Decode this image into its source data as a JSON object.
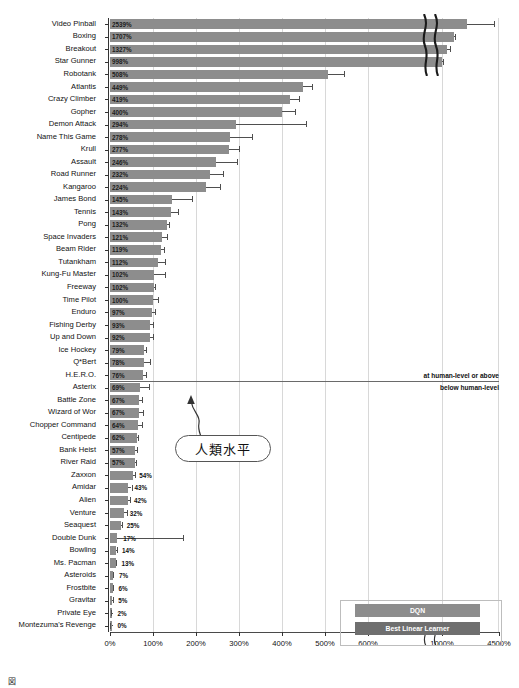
{
  "chart_data": {
    "type": "bar",
    "title": "",
    "xlabel": "",
    "ylabel": "",
    "orientation": "horizontal",
    "grid": true,
    "legend_position": "bottom-right",
    "xlim": [
      0,
      4500
    ],
    "axis_break": {
      "after": 600,
      "before": 1000,
      "note": "broken x-axis between 600% and 1000%"
    },
    "xticks": [
      "0%",
      "100%",
      "200%",
      "300%",
      "400%",
      "500%",
      "600%",
      "1000%",
      "4500%"
    ],
    "xtick_values": [
      0,
      100,
      200,
      300,
      400,
      500,
      600,
      1000,
      4500
    ],
    "human_level_value": 100,
    "categories": [
      "Video Pinball",
      "Boxing",
      "Breakout",
      "Star Gunner",
      "Robotank",
      "Atlantis",
      "Crazy Climber",
      "Gopher",
      "Demon Attack",
      "Name This Game",
      "Krull",
      "Assault",
      "Road Runner",
      "Kangaroo",
      "James Bond",
      "Tennis",
      "Pong",
      "Space Invaders",
      "Beam Rider",
      "Tutankham",
      "Kung-Fu Master",
      "Freeway",
      "Time Pilot",
      "Enduro",
      "Fishing Derby",
      "Up and Down",
      "Ice Hockey",
      "Q*Bert",
      "H.E.R.O.",
      "Asterix",
      "Battle Zone",
      "Wizard of Wor",
      "Chopper Command",
      "Centipede",
      "Bank Heist",
      "River Raid",
      "Zaxxon",
      "Amidar",
      "Alien",
      "Venture",
      "Seaquest",
      "Double Dunk",
      "Bowling",
      "Ms. Pacman",
      "Asteroids",
      "Frostbite",
      "Gravitar",
      "Private Eye",
      "Montezuma's Revenge"
    ],
    "values": [
      2539,
      1707,
      1327,
      998,
      508,
      449,
      419,
      400,
      294,
      278,
      277,
      246,
      232,
      224,
      145,
      143,
      132,
      121,
      119,
      112,
      102,
      102,
      100,
      97,
      93,
      92,
      79,
      78,
      76,
      69,
      67,
      67,
      64,
      62,
      57,
      57,
      54,
      43,
      42,
      32,
      25,
      17,
      14,
      13,
      7,
      6,
      5,
      2,
      0
    ],
    "value_labels": [
      "2539%",
      "1707%",
      "1327%",
      "998%",
      "508%",
      "449%",
      "419%",
      "400%",
      "294%",
      "278%",
      "277%",
      "246%",
      "232%",
      "224%",
      "145%",
      "143%",
      "132%",
      "121%",
      "119%",
      "112%",
      "102%",
      "102%",
      "100%",
      "97%",
      "93%",
      "92%",
      "79%",
      "78%",
      "76%",
      "69%",
      "67%",
      "67%",
      "64%",
      "62%",
      "57%",
      "57%",
      "54%",
      "43%",
      "42%",
      "32%",
      "25%",
      "17%",
      "14%",
      "13%",
      "7%",
      "6%",
      "5%",
      "2%",
      "0%"
    ],
    "error_high": [
      4200,
      1820,
      1480,
      1060,
      545,
      470,
      440,
      430,
      455,
      330,
      300,
      295,
      262,
      255,
      190,
      157,
      138,
      133,
      126,
      128,
      128,
      104,
      112,
      104,
      100,
      101,
      84,
      92,
      84,
      90,
      75,
      77,
      74,
      66,
      62,
      61,
      57,
      50,
      46,
      40,
      27,
      170,
      16,
      15,
      8,
      7,
      6,
      3,
      1
    ],
    "series": [
      {
        "name": "DQN",
        "color": "#8d8d8d"
      },
      {
        "name": "Best Linear Learner",
        "color": "#6f6f6f"
      }
    ]
  },
  "annotations": {
    "above_line_label": "at human-level or above",
    "below_line_label": "below human-level",
    "callout_text": "人類水平"
  },
  "legend": {
    "dqn_label": "DQN",
    "best_linear_label": "Best Linear Learner"
  },
  "caption": {
    "text": "図"
  }
}
